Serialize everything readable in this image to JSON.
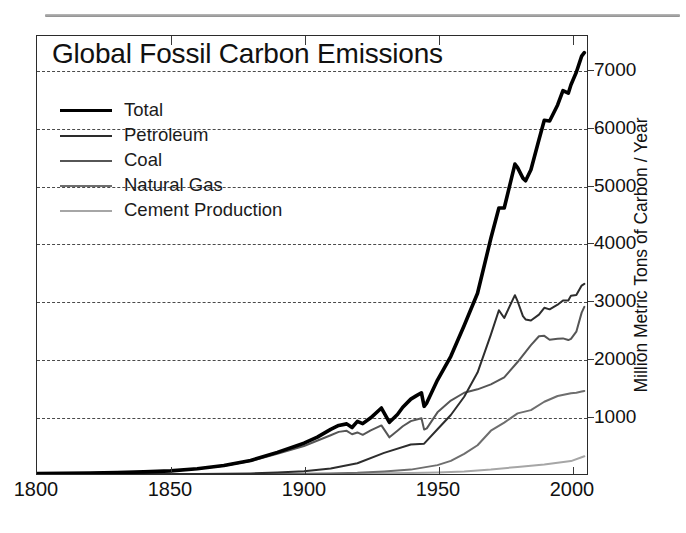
{
  "figure": {
    "top_rule": "horizontal-rule",
    "background_color": "#ffffff"
  },
  "chart_data": {
    "type": "line",
    "title": "Global Fossil Carbon Emissions",
    "xlabel": "",
    "ylabel": "Million Metric Tons of Carbon / Year",
    "xlim": [
      1800,
      2006
    ],
    "ylim": [
      0,
      7600
    ],
    "xticks": [
      1800,
      1850,
      1900,
      1950,
      2000
    ],
    "xtick_labels": [
      "1800",
      "1850",
      "1900",
      "1950",
      "2000"
    ],
    "yticks": [
      1000,
      2000,
      3000,
      4000,
      5000,
      6000,
      7000
    ],
    "ytick_labels": [
      "1000",
      "2000",
      "3000",
      "4000",
      "5000",
      "6000",
      "7000"
    ],
    "grid": true,
    "grid_style": "dashed-horizontal",
    "y_axis_position": "right",
    "legend_position": "upper-left",
    "series": [
      {
        "name": "Total",
        "color": "#000000",
        "width": 3.6,
        "x": [
          1800,
          1810,
          1820,
          1830,
          1840,
          1850,
          1860,
          1870,
          1880,
          1890,
          1900,
          1905,
          1910,
          1913,
          1916,
          1918,
          1920,
          1922,
          1925,
          1929,
          1932,
          1935,
          1937,
          1940,
          1942,
          1944,
          1945,
          1946,
          1950,
          1955,
          1960,
          1965,
          1970,
          1973,
          1975,
          1979,
          1980,
          1982,
          1983,
          1985,
          1988,
          1990,
          1992,
          1995,
          1997,
          1999,
          2000,
          2002,
          2004,
          2005
        ],
        "values": [
          8,
          12,
          17,
          25,
          37,
          54,
          91,
          147,
          236,
          375,
          534,
          640,
          775,
          843,
          870,
          806,
          913,
          874,
          975,
          1145,
          897,
          1032,
          1159,
          1299,
          1355,
          1409,
          1174,
          1235,
          1630,
          2043,
          2577,
          3136,
          4090,
          4615,
          4615,
          5378,
          5317,
          5134,
          5088,
          5279,
          5800,
          6138,
          6126,
          6403,
          6651,
          6608,
          6755,
          6970,
          7250,
          7310
        ]
      },
      {
        "name": "Petroleum",
        "color": "#2d2d2d",
        "width": 2.0,
        "x": [
          1800,
          1860,
          1870,
          1880,
          1890,
          1900,
          1910,
          1920,
          1930,
          1940,
          1945,
          1950,
          1955,
          1960,
          1965,
          1970,
          1973,
          1975,
          1979,
          1980,
          1982,
          1983,
          1985,
          1988,
          1990,
          1992,
          1995,
          1997,
          1999,
          2000,
          2002,
          2004,
          2005
        ],
        "values": [
          0,
          1,
          4,
          10,
          25,
          48,
          94,
          187,
          366,
          511,
          526,
          777,
          1024,
          1340,
          1760,
          2418,
          2842,
          2707,
          3103,
          2998,
          2740,
          2682,
          2664,
          2766,
          2884,
          2857,
          2937,
          3010,
          3010,
          3095,
          3105,
          3270,
          3300
        ]
      },
      {
        "name": "Coal",
        "color": "#565656",
        "width": 2.0,
        "x": [
          1800,
          1820,
          1840,
          1850,
          1860,
          1870,
          1880,
          1890,
          1900,
          1910,
          1913,
          1916,
          1918,
          1920,
          1922,
          1925,
          1929,
          1932,
          1935,
          1937,
          1940,
          1944,
          1945,
          1946,
          1950,
          1955,
          1960,
          1965,
          1970,
          1975,
          1980,
          1985,
          1988,
          1990,
          1992,
          1995,
          1997,
          1999,
          2000,
          2002,
          2004,
          2005
        ],
        "values": [
          8,
          17,
          37,
          54,
          90,
          143,
          225,
          350,
          486,
          673,
          731,
          749,
          690,
          721,
          680,
          757,
          843,
          636,
          750,
          828,
          917,
          967,
          771,
          792,
          1070,
          1275,
          1410,
          1469,
          1556,
          1676,
          1943,
          2237,
          2390,
          2397,
          2329,
          2346,
          2353,
          2324,
          2344,
          2470,
          2800,
          2900
        ]
      },
      {
        "name": "Natural Gas",
        "color": "#6e6e6e",
        "width": 2.0,
        "x": [
          1800,
          1890,
          1900,
          1910,
          1920,
          1930,
          1940,
          1950,
          1955,
          1960,
          1965,
          1970,
          1975,
          1980,
          1985,
          1990,
          1995,
          2000,
          2002,
          2004,
          2005
        ],
        "values": [
          0,
          1,
          3,
          8,
          20,
          45,
          76,
          154,
          228,
          348,
          499,
          751,
          891,
          1052,
          1108,
          1254,
          1353,
          1402,
          1410,
          1430,
          1440
        ]
      },
      {
        "name": "Cement Production",
        "color": "#a6a6a6",
        "width": 2.0,
        "x": [
          1800,
          1900,
          1920,
          1930,
          1940,
          1950,
          1960,
          1970,
          1980,
          1990,
          1995,
          2000,
          2004,
          2005
        ],
        "values": [
          0,
          2,
          7,
          12,
          17,
          26,
          45,
          78,
          123,
          166,
          194,
          224,
          290,
          307
        ]
      }
    ]
  },
  "legend": {
    "items": [
      {
        "label": "Total",
        "color": "#000000",
        "width": 3.8
      },
      {
        "label": "Petroleum",
        "color": "#2d2d2d",
        "width": 2.6
      },
      {
        "label": "Coal",
        "color": "#565656",
        "width": 2.6
      },
      {
        "label": "Natural Gas",
        "color": "#6e6e6e",
        "width": 2.6
      },
      {
        "label": "Cement Production",
        "color": "#a6a6a6",
        "width": 2.6
      }
    ]
  }
}
